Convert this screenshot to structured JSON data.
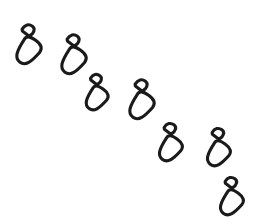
{
  "image": {
    "kind": "line-art-icon",
    "subject": "footprints-trail",
    "title": "Footprint Trail",
    "width": 253,
    "height": 218,
    "background_color": "#ffffff",
    "stroke_color": "#1a1a1a",
    "stroke_width": 3.1,
    "fill": "none",
    "description": "A diagonal trail of seven shoe footprints descending from the upper-left to the lower-right, each drawn as an outlined sole with a separate smaller heel mark.",
    "trail_direction": "upper-left to lower-right",
    "footprint_count": 7
  },
  "footprints": [
    {
      "id": "footprint-1",
      "order": 1,
      "side": "left",
      "center_x": 28,
      "center_y": 44,
      "rotation_deg": 36,
      "sole_rx": 10.5,
      "sole_ry": 13.5,
      "sole_offset_x": 4,
      "sole_offset_y": 6,
      "heel_w": 11,
      "heel_h": 10,
      "heel_offset_x": -8,
      "heel_offset_y": -12,
      "scale": 1.0
    },
    {
      "id": "footprint-2",
      "order": 2,
      "side": "right",
      "center_x": 73,
      "center_y": 54,
      "rotation_deg": 36,
      "sole_rx": 10.5,
      "sole_ry": 13.5,
      "sole_offset_x": 4,
      "sole_offset_y": 6,
      "heel_w": 11,
      "heel_h": 10,
      "heel_offset_x": -8,
      "heel_offset_y": -12,
      "scale": 1.0
    },
    {
      "id": "footprint-3",
      "order": 3,
      "side": "left",
      "center_x": 96,
      "center_y": 92,
      "rotation_deg": 36,
      "sole_rx": 9.5,
      "sole_ry": 12,
      "sole_offset_x": 4,
      "sole_offset_y": 5.5,
      "heel_w": 10,
      "heel_h": 9,
      "heel_offset_x": -7.5,
      "heel_offset_y": -11,
      "scale": 0.92
    },
    {
      "id": "footprint-4",
      "order": 4,
      "side": "right",
      "center_x": 141,
      "center_y": 99,
      "rotation_deg": 36,
      "sole_rx": 10.5,
      "sole_ry": 13.5,
      "sole_offset_x": 4,
      "sole_offset_y": 6,
      "heel_w": 11,
      "heel_h": 10,
      "heel_offset_x": -8,
      "heel_offset_y": -12,
      "scale": 1.0
    },
    {
      "id": "footprint-5",
      "order": 5,
      "side": "left",
      "center_x": 170,
      "center_y": 142,
      "rotation_deg": 36,
      "sole_rx": 10,
      "sole_ry": 12.5,
      "sole_offset_x": 4,
      "sole_offset_y": 6,
      "heel_w": 10.5,
      "heel_h": 9.5,
      "heel_offset_x": -8,
      "heel_offset_y": -11.5,
      "scale": 0.96
    },
    {
      "id": "footprint-6",
      "order": 6,
      "side": "right",
      "center_x": 218,
      "center_y": 147,
      "rotation_deg": 36,
      "sole_rx": 10,
      "sole_ry": 12.5,
      "sole_offset_x": 4,
      "sole_offset_y": 6,
      "heel_w": 10.5,
      "heel_h": 9.5,
      "heel_offset_x": -8,
      "heel_offset_y": -11.5,
      "scale": 0.96
    },
    {
      "id": "footprint-7",
      "order": 7,
      "side": "left",
      "center_x": 231,
      "center_y": 196,
      "rotation_deg": 36,
      "sole_rx": 10,
      "sole_ry": 12.5,
      "sole_offset_x": 4,
      "sole_offset_y": 6,
      "heel_w": 10.5,
      "heel_h": 9.5,
      "heel_offset_x": -8,
      "heel_offset_y": -11.5,
      "scale": 0.96
    }
  ]
}
